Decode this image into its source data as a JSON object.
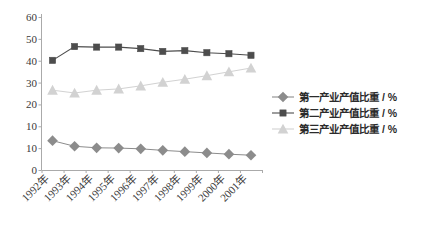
{
  "chart_data": {
    "type": "line",
    "title": "",
    "xlabel": "",
    "ylabel": "",
    "ylim": [
      0,
      60
    ],
    "grid": false,
    "legend_position": "right",
    "categories": [
      "1992年",
      "1993年",
      "1994年",
      "1995年",
      "1996年",
      "1997年",
      "1998年",
      "1999年",
      "2000年",
      "2001年"
    ],
    "ytick_labels": [
      "60",
      "50",
      "40",
      "30",
      "20",
      "10",
      "10",
      "0"
    ],
    "series": [
      {
        "name": "第一产业产值比重 / %",
        "marker": "diamond",
        "color": "#8c8c8c",
        "values": [
          11.5,
          9.3,
          8.7,
          8.6,
          8.3,
          7.7,
          7.2,
          6.7,
          6.2,
          5.8
        ]
      },
      {
        "name": "第二产业产值比重 / %",
        "marker": "square",
        "color": "#4d4d4d",
        "values": [
          43.0,
          48.4,
          48.2,
          48.2,
          47.6,
          46.5,
          46.8,
          46.0,
          45.6,
          45.0
        ]
      },
      {
        "name": "第三产业产值比重 / %",
        "marker": "triangle",
        "color": "#d2d2d2",
        "values": [
          31.3,
          30.2,
          31.3,
          31.8,
          33.0,
          34.4,
          35.6,
          37.0,
          38.5,
          40.0
        ]
      }
    ]
  },
  "legend": {
    "items": [
      {
        "label": "第一产业产值比重 / %",
        "marker": "diamond-marker-icon",
        "color": "#8c8c8c"
      },
      {
        "label": "第二产业产值比重 / %",
        "marker": "square-marker-icon",
        "color": "#4d4d4d"
      },
      {
        "label": "第三产业产值比重 / %",
        "marker": "triangle-marker-icon",
        "color": "#d2d2d2"
      }
    ]
  },
  "axis": {
    "y_labels": [
      "60",
      "50",
      "40",
      "30",
      "20",
      "10",
      "10",
      "0"
    ],
    "x_labels": [
      "1992年",
      "1993年",
      "1994年",
      "1995年",
      "1996年",
      "1997年",
      "1998年",
      "1999年",
      "2000年",
      "2001年"
    ]
  }
}
